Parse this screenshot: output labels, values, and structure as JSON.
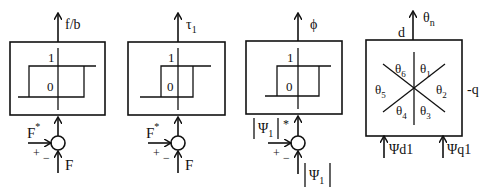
{
  "blocks": [
    {
      "id": "flux-comparator",
      "output_label": "f/b",
      "level_high": "1",
      "level_low": "0",
      "ref_input": "F",
      "ref_input_sup": "*",
      "feedback_input": "F",
      "plus_sign": "+",
      "minus_sign": "−"
    },
    {
      "id": "torque-comparator",
      "output_label": "τ",
      "output_sub": "1",
      "level_high": "1",
      "level_low": "0",
      "ref_input": "F",
      "ref_input_sup": "*",
      "feedback_input": "F",
      "plus_sign": "+",
      "minus_sign": "−"
    },
    {
      "id": "flux-magnitude-comparator",
      "output_label": "ϕ",
      "level_high": "1",
      "level_low": "0",
      "ref_input": "Ψ",
      "ref_input_sub": "1",
      "ref_input_sup": "*",
      "feedback_input": "Ψ",
      "feedback_input_sub": "1",
      "plus_sign": "+",
      "minus_sign": "−"
    }
  ],
  "sector_block": {
    "output_label": "θ",
    "output_sub": "n",
    "axis_d": "d",
    "axis_q": "-q",
    "sectors": [
      {
        "label": "θ",
        "sub": "6"
      },
      {
        "label": "θ",
        "sub": "1"
      },
      {
        "label": "θ",
        "sub": "2"
      },
      {
        "label": "θ",
        "sub": "3"
      },
      {
        "label": "θ",
        "sub": "4"
      },
      {
        "label": "θ",
        "sub": "5"
      }
    ],
    "input_d": "Ψd1",
    "input_q": "Ψq1"
  }
}
